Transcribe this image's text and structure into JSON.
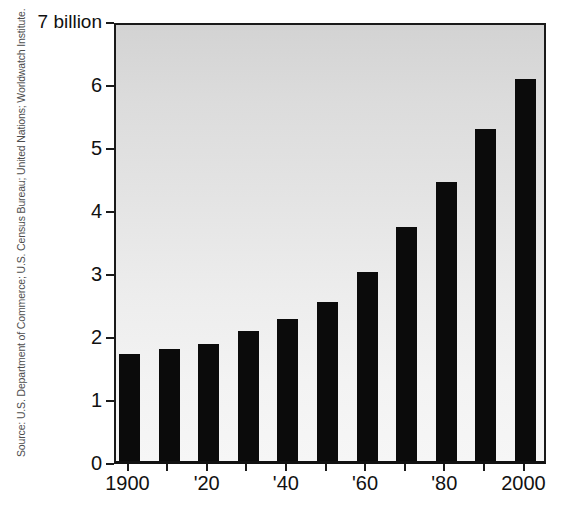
{
  "chart_data": {
    "type": "bar",
    "title": "",
    "subtitle": "",
    "xlabel": "",
    "ylabel": "",
    "unit_label": "7 billion",
    "categories": [
      "1900",
      "1910",
      "1920",
      "1930",
      "1940",
      "1950",
      "1960",
      "1970",
      "1980",
      "1990",
      "2000"
    ],
    "values": [
      1.7,
      1.78,
      1.86,
      2.07,
      2.25,
      2.52,
      3.0,
      3.72,
      4.43,
      5.27,
      6.06
    ],
    "x_tick_labels": [
      "1900",
      "'20",
      "'40",
      "'60",
      "'80",
      "2000"
    ],
    "x_tick_categories": [
      "1900",
      "1920",
      "1940",
      "1960",
      "1980",
      "2000"
    ],
    "y_tick_labels": [
      "7 billion",
      "6",
      "5",
      "4",
      "3",
      "2",
      "1",
      "0"
    ],
    "y_tick_values": [
      7,
      6,
      5,
      4,
      3,
      2,
      1,
      0
    ],
    "ylim": [
      0,
      7
    ],
    "grid": false,
    "legend": null,
    "bar_color": "#0b0b0b",
    "panel_background_top": "#d3d3d3",
    "panel_background_bottom": "#f6f6f6",
    "axis_color": "#1a1a1a"
  },
  "source": {
    "text": "Source: U.S. Department of Commerce; U.S. Census Bureau; United Nations; Worldwatch Institute."
  }
}
